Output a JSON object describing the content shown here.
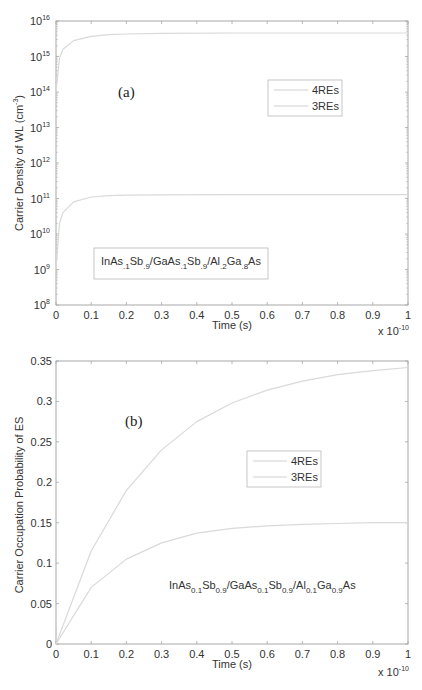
{
  "chart_data": [
    {
      "panel": "(a)",
      "type": "line",
      "title": "",
      "xlabel": "Time (s)",
      "ylabel": "Carrier Density of WL  (cm-3)",
      "x_multiplier": "x 10^-10",
      "x_ticks": [
        "0",
        "0.1",
        "0.2",
        "0.3",
        "0.4",
        "0.5",
        "0.6",
        "0.7",
        "0.8",
        "0.9",
        "1"
      ],
      "y_ticks": [
        "10^8",
        "10^9",
        "10^10",
        "10^11",
        "10^12",
        "10^13",
        "10^14",
        "10^15",
        "10^16"
      ],
      "xlim": [
        0,
        1
      ],
      "ylim": [
        100000000.0,
        1e+16
      ],
      "yscale": "log",
      "grid": false,
      "legend_position": "upper right (inside)",
      "annotation": "InAs.1Sb.9/GaAs.1Sb.9/Al.2Ga.8As",
      "x": [
        0,
        0.01,
        0.02,
        0.05,
        0.1,
        0.15,
        0.2,
        0.3,
        0.5,
        0.7,
        1.0
      ],
      "series": [
        {
          "name": "4REs",
          "values": [
            100000000000000.0,
            900000000000000.0,
            1600000000000000.0,
            2800000000000000.0,
            3700000000000000.0,
            4100000000000000.0,
            4300000000000000.0,
            4500000000000000.0,
            4600000000000000.0,
            4600000000000000.0,
            4600000000000000.0
          ]
        },
        {
          "name": "3REs",
          "values": [
            1000000000.0,
            20000000000.0,
            40000000000.0,
            80000000000.0,
            110000000000.0,
            120000000000.0,
            125000000000.0,
            127000000000.0,
            128000000000.0,
            128000000000.0,
            128000000000.0
          ]
        }
      ]
    },
    {
      "panel": "(b)",
      "type": "line",
      "title": "",
      "xlabel": "Time (s)",
      "ylabel": "Carrier Occupation Probability of ES",
      "x_multiplier": "x 10^-10",
      "x_ticks": [
        "0",
        "0.1",
        "0.2",
        "0.3",
        "0.4",
        "0.5",
        "0.6",
        "0.7",
        "0.8",
        "0.9",
        "1"
      ],
      "y_ticks": [
        "0",
        "0.05",
        "0.1",
        "0.15",
        "0.2",
        "0.25",
        "0.3",
        "0.35"
      ],
      "xlim": [
        0,
        1
      ],
      "ylim": [
        0,
        0.35
      ],
      "grid": false,
      "legend_position": "center right (inside)",
      "annotation": "InAs0.1Sb0.9/GaAs0.1Sb0.9/Al0.1Ga0.9As",
      "x": [
        0,
        0.1,
        0.2,
        0.3,
        0.4,
        0.5,
        0.6,
        0.7,
        0.8,
        0.9,
        1.0
      ],
      "series": [
        {
          "name": "4REs",
          "values": [
            0,
            0.115,
            0.19,
            0.24,
            0.275,
            0.298,
            0.314,
            0.325,
            0.333,
            0.338,
            0.342
          ]
        },
        {
          "name": "3REs",
          "values": [
            0,
            0.07,
            0.105,
            0.125,
            0.137,
            0.143,
            0.146,
            0.148,
            0.149,
            0.15,
            0.15
          ]
        }
      ]
    }
  ],
  "labels": {
    "a": {
      "panel": "(a)",
      "xlabel": "Time (s)",
      "ylabel": "Carrier Density of WL  (cm",
      "ylabel_sup": "-3",
      "ylabel_end": ")",
      "mult_base": "x 10",
      "mult_exp": "-10",
      "legend": [
        "4REs",
        "3REs"
      ],
      "xticks": [
        "0",
        "0.1",
        "0.2",
        "0.3",
        "0.4",
        "0.5",
        "0.6",
        "0.7",
        "0.8",
        "0.9",
        "1"
      ],
      "yexp": [
        "8",
        "9",
        "10",
        "11",
        "12",
        "13",
        "14",
        "15",
        "16"
      ],
      "ybase": "10",
      "note": [
        {
          "t": "InAs",
          "s": ""
        },
        {
          "t": ".1",
          "s": "sub"
        },
        {
          "t": "Sb",
          "s": ""
        },
        {
          "t": ".9",
          "s": "sub"
        },
        {
          "t": "/GaAs",
          "s": ""
        },
        {
          "t": ".1",
          "s": "sub"
        },
        {
          "t": "Sb",
          "s": ""
        },
        {
          "t": ".9",
          "s": "sub"
        },
        {
          "t": "/Al",
          "s": ""
        },
        {
          "t": ".2",
          "s": "sub"
        },
        {
          "t": "Ga",
          "s": ""
        },
        {
          "t": ".8",
          "s": "sub"
        },
        {
          "t": "As",
          "s": ""
        }
      ]
    },
    "b": {
      "panel": "(b)",
      "xlabel": "Time (s)",
      "ylabel": "Carrier Occupation Probability of ES",
      "mult_base": "x 10",
      "mult_exp": "-10",
      "legend": [
        "4REs",
        "3REs"
      ],
      "xticks": [
        "0",
        "0.1",
        "0.2",
        "0.3",
        "0.4",
        "0.5",
        "0.6",
        "0.7",
        "0.8",
        "0.9",
        "1"
      ],
      "yticks": [
        "0",
        "0.05",
        "0.1",
        "0.15",
        "0.2",
        "0.25",
        "0.3",
        "0.35"
      ],
      "note": [
        {
          "t": "InAs",
          "s": ""
        },
        {
          "t": "0.1",
          "s": "sub"
        },
        {
          "t": "Sb",
          "s": ""
        },
        {
          "t": "0.9",
          "s": "sub"
        },
        {
          "t": "/GaAs",
          "s": ""
        },
        {
          "t": "0.1",
          "s": "sub"
        },
        {
          "t": "Sb",
          "s": ""
        },
        {
          "t": "0.9",
          "s": "sub"
        },
        {
          "t": "/Al",
          "s": ""
        },
        {
          "t": "0.1",
          "s": "sub"
        },
        {
          "t": "Ga",
          "s": ""
        },
        {
          "t": "0.9",
          "s": "sub"
        },
        {
          "t": "As",
          "s": ""
        }
      ]
    }
  },
  "colors": {
    "axis": "#a8a8a8",
    "curve": "#d9d9d9",
    "text": "#333333",
    "legend_border": "#b8b8b8"
  }
}
